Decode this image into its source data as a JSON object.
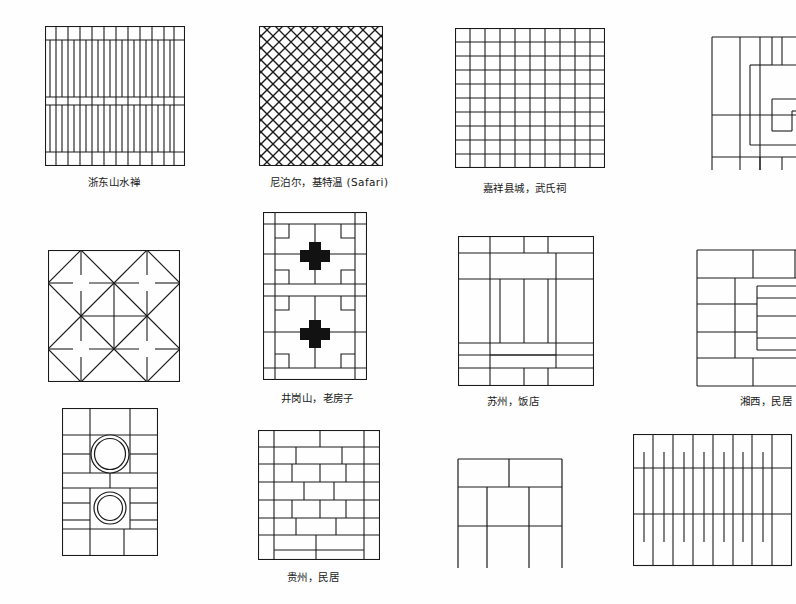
{
  "page": {
    "width": 796,
    "height": 604,
    "background_color": "#fefefe",
    "ink_color": "#1a1a1a"
  },
  "figures": [
    {
      "id": "fig-1",
      "caption": "浙东山水禅",
      "pattern": "vertical-plank-bands",
      "row": 1,
      "column": 1
    },
    {
      "id": "fig-2",
      "caption": "尼泊尔，基特温 (Safari)",
      "pattern": "diagonal-lattice-diamond",
      "row": 1,
      "column": 2
    },
    {
      "id": "fig-3",
      "caption": "嘉祥县城，武氏祠",
      "pattern": "square-grid",
      "row": 1,
      "column": 3
    },
    {
      "id": "fig-4",
      "caption": "",
      "pattern": "rectangular-spiral-slabs",
      "row": 1,
      "column": 4
    },
    {
      "id": "fig-5",
      "caption": "",
      "pattern": "octagon-diamond-tiles",
      "row": 2,
      "column": 1
    },
    {
      "id": "fig-6",
      "caption": "井岗山，老房子",
      "pattern": "cross-medallion-court",
      "row": 2,
      "column": 2
    },
    {
      "id": "fig-7",
      "caption": "苏州，饭店",
      "pattern": "interlocking-rectangles",
      "row": 2,
      "column": 3
    },
    {
      "id": "fig-8",
      "caption": "湘西，民居",
      "pattern": "nested-slab-frame",
      "row": 2,
      "column": 4
    },
    {
      "id": "fig-9",
      "caption": "",
      "pattern": "twin-well-circles",
      "row": 3,
      "column": 1
    },
    {
      "id": "fig-10",
      "caption": "贵州，民居",
      "pattern": "running-bond-brick",
      "row": 3,
      "column": 2
    },
    {
      "id": "fig-11",
      "caption": "",
      "pattern": "coarse-slab-grid",
      "row": 3,
      "column": 3
    },
    {
      "id": "fig-12",
      "caption": "",
      "pattern": "vertical-stripes-with-ticks",
      "row": 3,
      "column": 4
    }
  ]
}
